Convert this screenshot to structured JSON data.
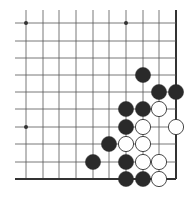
{
  "board": {
    "type": "go-board-fragment",
    "colors": {
      "background": "#ffffff",
      "line": "#555555",
      "edge": "#333333",
      "black_stone": "#2a2a2a",
      "white_stone": "#ffffff",
      "white_stroke": "#333333"
    },
    "columns_x": [
      26,
      43,
      59,
      76,
      93,
      109,
      126,
      143,
      159,
      176
    ],
    "rows_y": [
      23,
      41,
      58,
      75,
      92,
      109,
      127,
      144,
      162,
      179
    ],
    "line_extent": {
      "left": 15,
      "top": 10
    },
    "edges": [
      "right",
      "bottom"
    ],
    "star_points": [
      [
        0,
        0
      ],
      [
        6,
        0
      ],
      [
        0,
        6
      ]
    ],
    "stones": [
      {
        "color": "black",
        "col": 7,
        "row": 3
      },
      {
        "color": "black",
        "col": 8,
        "row": 4
      },
      {
        "color": "black",
        "col": 9,
        "row": 4
      },
      {
        "color": "black",
        "col": 6,
        "row": 5
      },
      {
        "color": "black",
        "col": 7,
        "row": 5
      },
      {
        "color": "white",
        "col": 8,
        "row": 5
      },
      {
        "color": "black",
        "col": 6,
        "row": 6
      },
      {
        "color": "white",
        "col": 7,
        "row": 6
      },
      {
        "color": "white",
        "col": 9,
        "row": 6
      },
      {
        "color": "black",
        "col": 5,
        "row": 7
      },
      {
        "color": "white",
        "col": 6,
        "row": 7
      },
      {
        "color": "white",
        "col": 7,
        "row": 7
      },
      {
        "color": "black",
        "col": 4,
        "row": 8
      },
      {
        "color": "black",
        "col": 6,
        "row": 8
      },
      {
        "color": "white",
        "col": 7,
        "row": 8
      },
      {
        "color": "white",
        "col": 8,
        "row": 8
      },
      {
        "color": "black",
        "col": 6,
        "row": 9
      },
      {
        "color": "black",
        "col": 7,
        "row": 9
      },
      {
        "color": "white",
        "col": 8,
        "row": 9
      }
    ]
  }
}
